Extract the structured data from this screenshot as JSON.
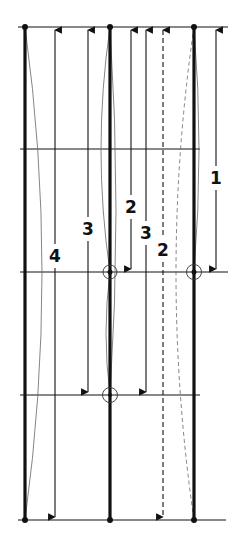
{
  "diagram": {
    "type": "column-buckling-lengths",
    "colors": {
      "ink": "#111111",
      "thin": "#555555",
      "background": "#ffffff"
    },
    "levels_y": [
      27,
      149,
      272,
      395,
      520
    ],
    "posts": [
      {
        "id": "left",
        "x": 25
      },
      {
        "id": "middle",
        "x": 110
      },
      {
        "id": "right",
        "x": 194
      }
    ],
    "braced_nodes": [
      {
        "x": 110,
        "y": 272
      },
      {
        "x": 194,
        "y": 272
      },
      {
        "x": 110,
        "y": 395
      }
    ],
    "dimensions": [
      {
        "label": "4",
        "x": 55,
        "y1": 27,
        "y2": 520,
        "label_y": 256,
        "dashed": false
      },
      {
        "label": "3",
        "x": 88,
        "y1": 27,
        "y2": 395,
        "label_y": 229,
        "dashed": false
      },
      {
        "label": "2",
        "x": 131,
        "y1": 27,
        "y2": 272,
        "label_y": 207,
        "dashed": false
      },
      {
        "label": "3",
        "x": 146,
        "y1": 27,
        "y2": 395,
        "label_y": 233,
        "dashed": false
      },
      {
        "label": "2",
        "x": 163,
        "y1": 27,
        "y2": 520,
        "label_y": 250,
        "dashed": true
      },
      {
        "label": "1",
        "x": 216,
        "y1": 27,
        "y2": 272,
        "label_y": 178,
        "dashed": false
      }
    ]
  }
}
